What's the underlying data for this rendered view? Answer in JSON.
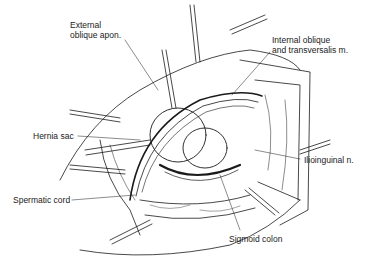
{
  "figure": {
    "type": "surgical-illustration"
  },
  "labels": [
    {
      "id": "external-oblique",
      "lines": [
        "External",
        "oblique apon."
      ],
      "x": 70,
      "y": 20
    },
    {
      "id": "internal-oblique",
      "lines": [
        "Internal oblique",
        "and transversalis m."
      ],
      "x": 272,
      "y": 35
    },
    {
      "id": "hernia-sac",
      "lines": [
        "Hernia sac"
      ],
      "x": 33,
      "y": 131
    },
    {
      "id": "ilioinguinal",
      "lines": [
        "Ilioinguinal n."
      ],
      "x": 304,
      "y": 155
    },
    {
      "id": "spermatic-cord",
      "lines": [
        "Spermatic cord"
      ],
      "x": 13,
      "y": 195
    },
    {
      "id": "sigmoid-colon",
      "lines": [
        "Sigmoid colon"
      ],
      "x": 229,
      "y": 234
    }
  ],
  "colors": {
    "ink": "#1a1a1a",
    "background": "#ffffff"
  }
}
